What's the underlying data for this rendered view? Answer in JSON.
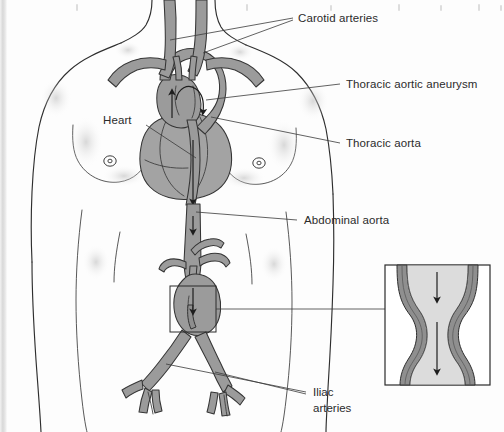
{
  "figure": {
    "background_color": "#fdfdfd",
    "vessel_color": "#9b9b9b",
    "outline_color": "#2e2e2e",
    "text_color": "#2b2b2b",
    "lumen_color": "#dcdcdc"
  },
  "labels": {
    "carotid_arteries": "Carotid arteries",
    "thoracic_aortic_aneurysm": "Thoracic aortic aneurysm",
    "thoracic_aorta": "Thoracic aorta",
    "heart": "Heart",
    "abdominal_aorta": "Abdominal aorta",
    "iliac_line1": "Iliac",
    "iliac_line2": "arteries"
  },
  "icons": {
    "flow_arrow": "downward-flow-arrow",
    "upward_flow_arrow": "upward-flow-arrow",
    "nipple_mark": "nipple-marker",
    "callout_rect": "magnified-region-rectangle"
  },
  "inset": {
    "name": "abdominal-aortic-aneurysm-detail",
    "arrow_count": 2,
    "wall_color": "#8f8f8f",
    "lumen_color": "#dcdcdc"
  }
}
